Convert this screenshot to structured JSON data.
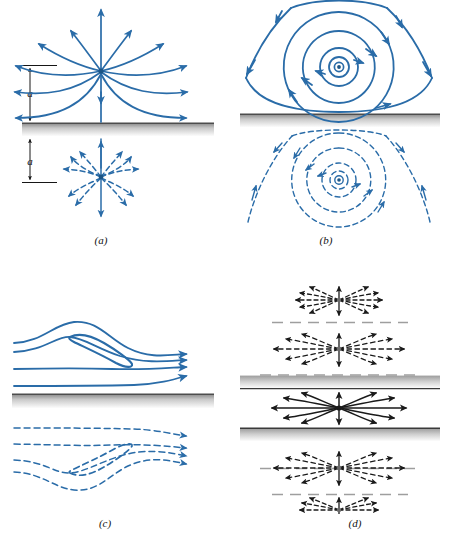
{
  "figure": {
    "title": "",
    "colors": {
      "blue": "#2a6ca8",
      "blue_dark": "#1c5585",
      "black": "#1a1a1a",
      "wall_line": "#4d4d4d",
      "wall_shade_top": "#9a9a9a",
      "wall_shade_bottom": "#ffffff",
      "image_wall_dash": "#9e9e9e",
      "background": "#ffffff"
    },
    "panels": [
      {
        "id": "a",
        "caption": "(a)",
        "kind": "source-near-wall",
        "dimension_labels": [
          "a",
          "a"
        ],
        "real_flow_style": "solid",
        "image_flow_style": "dashed",
        "wall_count": 1,
        "singularity_symbol": "point-source",
        "ray_count": 12
      },
      {
        "id": "b",
        "caption": "(b)",
        "kind": "vortex-near-wall",
        "dimension_labels": [],
        "real_flow_style": "solid",
        "image_flow_style": "dashed",
        "wall_count": 1,
        "singularity_symbol": "vortex-center-dot",
        "streamline_count": 5
      },
      {
        "id": "c",
        "caption": "(c)",
        "kind": "half-body-near-wall",
        "dimension_labels": [],
        "real_flow_style": "solid",
        "image_flow_style": "dashed",
        "wall_count": 1,
        "singularity_symbol": "rankine-half-body",
        "streamline_count": 4
      },
      {
        "id": "d",
        "caption": "(d)",
        "kind": "source-between-two-walls",
        "dimension_labels": [],
        "real_flow_style": "solid",
        "image_flow_style": "dashed",
        "wall_count": 2,
        "singularity_symbol": "point-source",
        "image_count": 6,
        "ray_count": 12
      }
    ]
  }
}
